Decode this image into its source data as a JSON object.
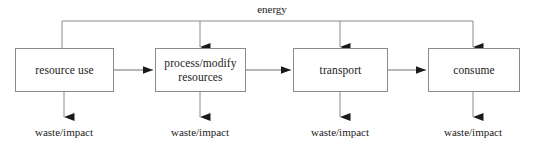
{
  "diagram": {
    "title_label": "energy",
    "boxes": [
      {
        "id": "resource-use",
        "label": "resource use",
        "x": 15,
        "y": 48,
        "w": 99,
        "h": 44
      },
      {
        "id": "process-modify-resources",
        "label": "process/modify\nresources",
        "x": 155,
        "y": 48,
        "w": 91,
        "h": 44
      },
      {
        "id": "transport",
        "label": "transport",
        "x": 293,
        "y": 48,
        "w": 95,
        "h": 44
      },
      {
        "id": "consume",
        "label": "consume",
        "x": 428,
        "y": 48,
        "w": 92,
        "h": 44
      }
    ],
    "outputs": [
      {
        "id": "waste-impact-1",
        "label": "waste/impact",
        "cx": 64,
        "y": 125
      },
      {
        "id": "waste-impact-2",
        "label": "waste/impact",
        "cx": 200,
        "y": 125
      },
      {
        "id": "waste-impact-3",
        "label": "waste/impact",
        "cx": 340,
        "y": 125
      },
      {
        "id": "waste-impact-4",
        "label": "waste/impact",
        "cx": 473,
        "y": 125
      }
    ],
    "flow_arrows": [
      {
        "id": "flow-1-to-2",
        "from": "resource-use",
        "to": "process-modify-resources"
      },
      {
        "id": "flow-2-to-3",
        "from": "process-modify-resources",
        "to": "transport"
      },
      {
        "id": "flow-3-to-4",
        "from": "transport",
        "to": "consume"
      }
    ],
    "energy_bus": {
      "label": "energy",
      "y": 21,
      "x_start": 62,
      "x_end": 473,
      "drops": [
        62,
        200,
        340,
        473
      ]
    },
    "colors": {
      "stroke": "#8a8a8a",
      "arrow_fill": "#1a1a1a",
      "text": "#1a1a1a",
      "background": "#ffffff"
    }
  }
}
